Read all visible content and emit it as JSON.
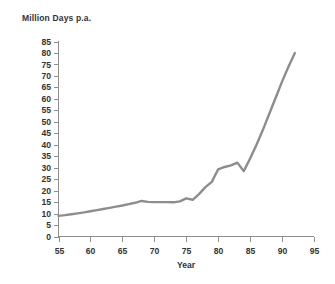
{
  "chart_data": {
    "type": "line",
    "title": "",
    "ylabel": "Million Days p.a.",
    "xlabel": "Year",
    "xlim": [
      55,
      95
    ],
    "ylim": [
      0,
      85
    ],
    "grid": false,
    "legend": "none",
    "xticks": [
      "55",
      "60",
      "65",
      "70",
      "75",
      "80",
      "85",
      "90",
      "95"
    ],
    "yticks": [
      "0",
      "5",
      "10",
      "15",
      "20",
      "25",
      "30",
      "35",
      "40",
      "45",
      "50",
      "55",
      "60",
      "65",
      "70",
      "75",
      "80",
      "85"
    ],
    "xtick_values": [
      55,
      60,
      65,
      70,
      75,
      80,
      85,
      90,
      95
    ],
    "ytick_values": [
      0,
      5,
      10,
      15,
      20,
      25,
      30,
      35,
      40,
      45,
      50,
      55,
      60,
      65,
      70,
      75,
      80,
      85
    ],
    "x_step": 5,
    "y_step": 5,
    "series": [
      {
        "name": "Million Days p.a.",
        "color": "#8d8d8d",
        "x": [
          55,
          56,
          57,
          58,
          59,
          60,
          61,
          62,
          63,
          64,
          65,
          66,
          67,
          68,
          69,
          70,
          71,
          72,
          73,
          74,
          75,
          76,
          77,
          78,
          79,
          80,
          81,
          82,
          83,
          84,
          85,
          86,
          87,
          88,
          89,
          90,
          91,
          92
        ],
        "values": [
          9.0,
          9.3,
          9.7,
          10.1,
          10.5,
          11.0,
          11.5,
          12.0,
          12.5,
          13.0,
          13.5,
          14.1,
          14.7,
          15.5,
          15.1,
          15.0,
          15.0,
          15.0,
          14.9,
          15.3,
          16.6,
          16.0,
          18.5,
          21.5,
          23.8,
          29.3,
          30.3,
          31.0,
          32.2,
          28.5,
          34.0,
          40.0,
          46.5,
          53.5,
          60.5,
          67.5,
          74.0,
          80.0
        ]
      }
    ]
  },
  "axis_colors": {
    "axis": "#8e8e8e",
    "text": "#333333",
    "line": "#8d8d8d",
    "background": "#ffffff"
  }
}
